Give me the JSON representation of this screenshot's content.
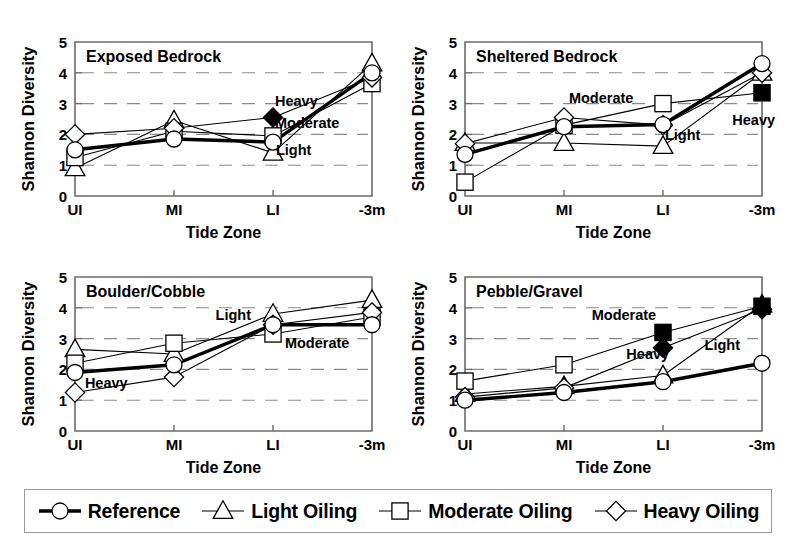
{
  "figure": {
    "axis_titles": {
      "x": "Tide Zone",
      "y": "Shannon Diversity"
    },
    "y_ticks": [
      "0",
      "1",
      "2",
      "3",
      "4",
      "5"
    ],
    "x_ticks": [
      "UI",
      "MI",
      "LI",
      "-3m"
    ]
  },
  "legend": {
    "items": [
      {
        "label": "Reference",
        "marker": "circle",
        "filled": false,
        "line": "thick",
        "icon": "circle-marker-icon"
      },
      {
        "label": "Light Oiling",
        "marker": "triangle",
        "filled": false,
        "line": "thin",
        "icon": "triangle-marker-icon"
      },
      {
        "label": "Moderate Oiling",
        "marker": "square",
        "filled": false,
        "line": "thin",
        "icon": "square-marker-icon"
      },
      {
        "label": "Heavy Oiling",
        "marker": "diamond",
        "filled": false,
        "line": "thin",
        "icon": "diamond-marker-icon"
      }
    ]
  },
  "panels": [
    {
      "id": "exposed-bedrock",
      "title": "Exposed Bedrock",
      "annotations": [
        {
          "text": "Heavy",
          "x": 2.02,
          "y": 2.93
        },
        {
          "text": "Moderate",
          "x": 2.02,
          "y": 2.22
        },
        {
          "text": "Light",
          "x": 2.03,
          "y": 1.34
        }
      ]
    },
    {
      "id": "sheltered-bedrock",
      "title": "Sheltered Bedrock",
      "annotations": [
        {
          "text": "Moderate",
          "x": 1.05,
          "y": 3.02
        },
        {
          "text": "Light",
          "x": 2.02,
          "y": 1.83
        },
        {
          "text": "Heavy",
          "x": 2.7,
          "y": 2.32
        }
      ]
    },
    {
      "id": "boulder-cobble",
      "title": "Boulder/Cobble",
      "annotations": [
        {
          "text": "Light",
          "x": 1.42,
          "y": 3.62
        },
        {
          "text": "Moderate",
          "x": 2.12,
          "y": 2.68
        },
        {
          "text": "Heavy",
          "x": 0.1,
          "y": 1.4
        }
      ]
    },
    {
      "id": "pebble-gravel",
      "title": "Pebble/Gravel",
      "annotations": [
        {
          "text": "Moderate",
          "x": 1.28,
          "y": 3.62
        },
        {
          "text": "Heavy",
          "x": 1.63,
          "y": 2.35
        },
        {
          "text": "Light",
          "x": 2.42,
          "y": 2.62
        }
      ]
    }
  ],
  "chart_data": [
    {
      "type": "line",
      "title": "Exposed Bedrock",
      "xlabel": "Tide Zone",
      "ylabel": "Shannon Diversity",
      "categories": [
        "UI",
        "MI",
        "LI",
        "-3m"
      ],
      "ylim": [
        0,
        5
      ],
      "grid": true,
      "legend_position": "bottom-shared",
      "series": [
        {
          "name": "Reference",
          "marker": "circle",
          "values": [
            1.5,
            1.85,
            1.75,
            4.0
          ]
        },
        {
          "name": "Light Oiling",
          "marker": "triangle",
          "values": [
            0.9,
            2.45,
            1.4,
            4.3
          ]
        },
        {
          "name": "Moderate Oiling",
          "marker": "square",
          "values": [
            1.25,
            2.1,
            1.95,
            3.65
          ]
        },
        {
          "name": "Heavy Oiling",
          "marker": "diamond",
          "values": [
            2.0,
            2.2,
            2.55,
            3.85
          ]
        }
      ],
      "filled_markers": [
        {
          "series": "Heavy Oiling",
          "category": "LI"
        }
      ]
    },
    {
      "type": "line",
      "title": "Sheltered Bedrock",
      "xlabel": "Tide Zone",
      "ylabel": "Shannon Diversity",
      "categories": [
        "UI",
        "MI",
        "LI",
        "-3m"
      ],
      "ylim": [
        0,
        5
      ],
      "grid": true,
      "legend_position": "bottom-shared",
      "series": [
        {
          "name": "Reference",
          "marker": "circle",
          "values": [
            1.35,
            2.25,
            2.32,
            4.3
          ]
        },
        {
          "name": "Light Oiling",
          "marker": "triangle",
          "values": [
            1.72,
            1.72,
            1.62,
            4.0
          ]
        },
        {
          "name": "Moderate Oiling",
          "marker": "square",
          "values": [
            0.45,
            2.3,
            3.0,
            3.35
          ]
        },
        {
          "name": "Heavy Oiling",
          "marker": "diamond",
          "values": [
            1.7,
            2.55,
            2.3,
            4.0
          ]
        }
      ],
      "filled_markers": [
        {
          "series": "Moderate Oiling",
          "category": "-3m"
        }
      ]
    },
    {
      "type": "line",
      "title": "Boulder/Cobble",
      "xlabel": "Tide Zone",
      "ylabel": "Shannon Diversity",
      "categories": [
        "UI",
        "MI",
        "LI",
        "-3m"
      ],
      "ylim": [
        0,
        5
      ],
      "grid": true,
      "legend_position": "bottom-shared",
      "series": [
        {
          "name": "Reference",
          "marker": "circle",
          "values": [
            1.9,
            2.15,
            3.45,
            3.45
          ]
        },
        {
          "name": "Light Oiling",
          "marker": "triangle",
          "values": [
            2.65,
            2.5,
            3.8,
            4.25
          ]
        },
        {
          "name": "Moderate Oiling",
          "marker": "square",
          "values": [
            2.2,
            2.85,
            3.15,
            3.7
          ]
        },
        {
          "name": "Heavy Oiling",
          "marker": "diamond",
          "values": [
            1.25,
            1.75,
            3.45,
            3.85
          ]
        }
      ],
      "filled_markers": []
    },
    {
      "type": "line",
      "title": "Pebble/Gravel",
      "xlabel": "Tide Zone",
      "ylabel": "Shannon Diversity",
      "categories": [
        "UI",
        "MI",
        "LI",
        "-3m"
      ],
      "ylim": [
        0,
        5
      ],
      "grid": true,
      "legend_position": "bottom-shared",
      "series": [
        {
          "name": "Reference",
          "marker": "circle",
          "values": [
            1.0,
            1.25,
            1.6,
            2.2
          ]
        },
        {
          "name": "Light Oiling",
          "marker": "triangle",
          "values": [
            1.2,
            1.45,
            1.8,
            4.1
          ]
        },
        {
          "name": "Moderate Oiling",
          "marker": "square",
          "values": [
            1.62,
            2.15,
            3.2,
            4.05
          ]
        },
        {
          "name": "Heavy Oiling",
          "marker": "diamond",
          "values": [
            1.1,
            1.4,
            2.7,
            3.95
          ]
        }
      ],
      "filled_markers": [
        {
          "series": "Moderate Oiling",
          "category": "LI"
        },
        {
          "series": "Heavy Oiling",
          "category": "LI"
        },
        {
          "series": "Light Oiling",
          "category": "-3m"
        },
        {
          "series": "Moderate Oiling",
          "category": "-3m"
        },
        {
          "series": "Heavy Oiling",
          "category": "-3m"
        }
      ]
    }
  ]
}
